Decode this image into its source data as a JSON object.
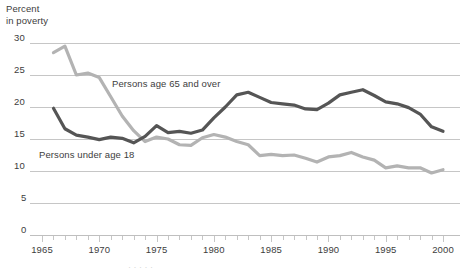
{
  "chart_data": {
    "type": "line",
    "title": "",
    "ylabel": "Percent\nin poverty",
    "xlabel": "",
    "ylim": [
      0,
      30
    ],
    "xlim": [
      1965,
      2000
    ],
    "yticks": [
      "0",
      "5",
      "10",
      "15",
      "20",
      "25",
      "30"
    ],
    "ytick_values": [
      0,
      5,
      10,
      15,
      20,
      25,
      30
    ],
    "xticks": [
      "1965",
      "1970",
      "1975",
      "1980",
      "1985",
      "1990",
      "1995",
      "2000"
    ],
    "xtick_values": [
      1965,
      1970,
      1975,
      1980,
      1985,
      1990,
      1995,
      2000
    ],
    "grid": "horizontal",
    "legend_position": "inline-annotations",
    "x": [
      1966,
      1967,
      1968,
      1969,
      1970,
      1971,
      1972,
      1973,
      1974,
      1975,
      1976,
      1977,
      1978,
      1979,
      1980,
      1981,
      1982,
      1983,
      1984,
      1985,
      1986,
      1987,
      1988,
      1989,
      1990,
      1991,
      1992,
      1993,
      1994,
      1995,
      1996,
      1997,
      1998,
      1999,
      2000
    ],
    "series": [
      {
        "name": "Persons age 65 and over",
        "color": "#b3b3b3",
        "values": [
          28.5,
          29.5,
          25.0,
          25.3,
          24.6,
          21.6,
          18.6,
          16.3,
          14.6,
          15.3,
          15.0,
          14.1,
          14.0,
          15.2,
          15.7,
          15.3,
          14.6,
          14.1,
          12.4,
          12.6,
          12.4,
          12.5,
          12.0,
          11.4,
          12.2,
          12.4,
          12.9,
          12.2,
          11.7,
          10.5,
          10.8,
          10.5,
          10.5,
          9.7,
          10.2
        ]
      },
      {
        "name": "Persons under age 18",
        "color": "#555555",
        "values": [
          19.8,
          16.6,
          15.6,
          15.3,
          14.9,
          15.3,
          15.1,
          14.4,
          15.4,
          17.1,
          16.0,
          16.2,
          15.9,
          16.4,
          18.3,
          20.0,
          21.9,
          22.3,
          21.5,
          20.7,
          20.5,
          20.3,
          19.7,
          19.6,
          20.6,
          21.9,
          22.3,
          22.7,
          21.8,
          20.8,
          20.5,
          19.9,
          18.9,
          16.9,
          16.2
        ]
      }
    ]
  },
  "axes": {
    "y_title_line1": "Percent",
    "y_title_line2": "in poverty"
  },
  "annotations": {
    "elderly_label": "Persons age 65 and over",
    "children_label": "Persons under age 18"
  },
  "caption": {
    "partial_text": "  ·   ·      ·  ·    ·"
  },
  "colors": {
    "elderly_line": "#b3b3b3",
    "children_line": "#555555",
    "gridline": "#bfbfbf",
    "text": "#3d3d3d"
  }
}
